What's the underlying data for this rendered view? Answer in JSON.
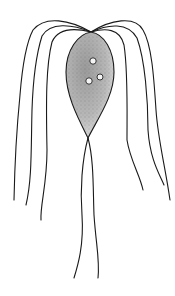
{
  "figure": {
    "subject": "flagellate protozoan illustration",
    "colors": {
      "background": "#ffffff",
      "line": "#1a1a1a",
      "body_fill_dark": "#8a8a8a",
      "body_fill_light": "#e6e6e6",
      "granule": "#f4f4f4"
    },
    "body": {
      "apex": [
        91,
        32
      ],
      "tip": [
        88,
        138
      ],
      "width_max": 48
    },
    "granules": [
      [
        93,
        61
      ],
      [
        89,
        81
      ],
      [
        100,
        77
      ]
    ],
    "flagella_count": 10
  }
}
